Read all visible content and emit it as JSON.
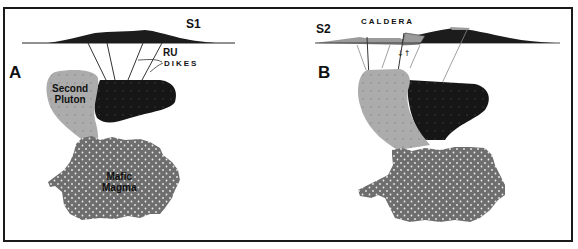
{
  "panels": [
    {
      "id": "A",
      "letter": "A",
      "stage": "S1",
      "labels": {
        "ru": "RU",
        "dikes": "DIKES",
        "pluton": [
          "Second",
          "Pluton"
        ],
        "magma": [
          "Mafic",
          "Magma"
        ]
      }
    },
    {
      "id": "B",
      "letter": "B",
      "stage": "S2",
      "labels": {
        "caldera": "CALDERA"
      }
    }
  ],
  "colors": {
    "border": "#1a1a1a",
    "volcano": "#1c1c1c",
    "first_pluton": "#141414",
    "second_pluton": "#a9a9a9",
    "mafic_magma": "#6e6e6e",
    "dots": "#e8e8e8",
    "caldera_block": "#9a9a9a"
  }
}
